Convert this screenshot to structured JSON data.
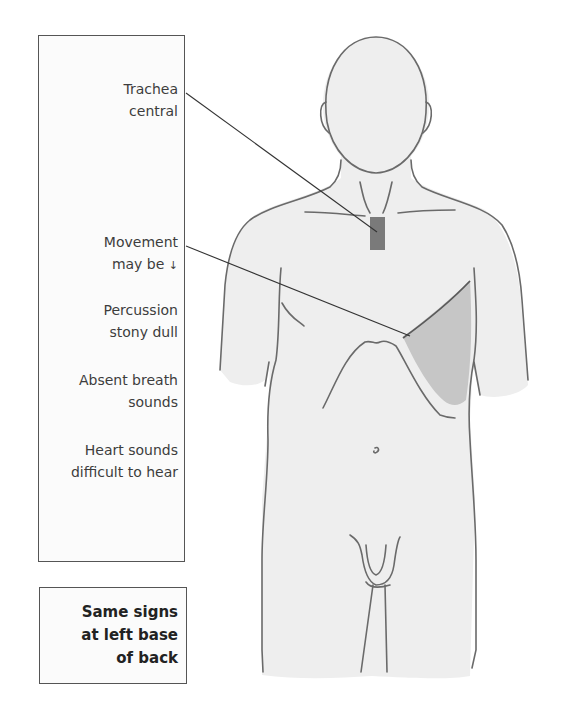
{
  "figure": {
    "colors": {
      "skin": "#eeeeee",
      "outline": "#6a6a6a",
      "trachea_marker": "#7a7a7a",
      "effusion_shading": "#c8c8c8",
      "leader_line": "#333333",
      "box_border": "#555555"
    }
  },
  "signs_box": {
    "labels": [
      {
        "line1": "Trachea",
        "line2": "central"
      },
      {
        "line1": "Movement",
        "line2": "may be",
        "arrow": "↓"
      },
      {
        "line1": "Percussion",
        "line2": "stony dull"
      },
      {
        "line1": "Absent breath",
        "line2": "sounds"
      },
      {
        "line1": "Heart sounds",
        "line2": "difficult to hear"
      }
    ]
  },
  "summary_box": {
    "text": "Same signs\nat left base\nof back"
  }
}
